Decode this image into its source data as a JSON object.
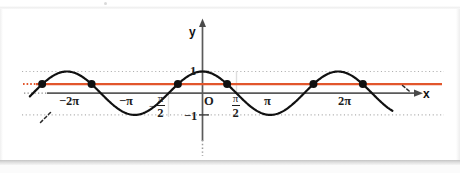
{
  "figure": {
    "axis_labels": {
      "x": "x",
      "y": "y",
      "origin": "O"
    },
    "y_ticks": [
      {
        "value": 1,
        "label": "1"
      },
      {
        "value": -1,
        "label": "−1"
      }
    ],
    "x_ticks": [
      {
        "value": -6.2832,
        "label": "−2π",
        "kind": "plain"
      },
      {
        "value": -3.1416,
        "label": "−π",
        "kind": "plain"
      },
      {
        "value": -1.5708,
        "label": "−π/2",
        "kind": "fraction",
        "sign": "−",
        "num": "π",
        "den": "2"
      },
      {
        "value": 1.5708,
        "label": "π/2",
        "kind": "fraction",
        "sign": "",
        "num": "π",
        "den": "2"
      },
      {
        "value": 3.1416,
        "label": "π",
        "kind": "plain"
      },
      {
        "value": 6.2832,
        "label": "2π",
        "kind": "plain"
      }
    ],
    "colors": {
      "curve": "#111111",
      "horizontal_line": "#e2562c",
      "axis": "#4f4f4f",
      "gridline": "#b9b9b9",
      "point": "#111111",
      "page": "#ffffff"
    }
  },
  "chart_data": {
    "type": "line",
    "title": "",
    "subtitle": "",
    "xlabel": "x",
    "ylabel": "y",
    "xlim": [
      -8.8,
      9.4
    ],
    "ylim": [
      -1.45,
      1.75
    ],
    "grid": "dotted horizontal gridlines at y = 1 and y = -1",
    "legend": "none",
    "series": [
      {
        "name": "y = cos x",
        "type": "line",
        "expression": "cos(x)",
        "color": "#111111",
        "linestyle": "solid",
        "linewidth": 2,
        "x_range": [
          -8.0,
          8.8
        ],
        "amplitude": 1,
        "period": 6.2832,
        "key_points": [
          {
            "x": -6.2832,
            "y": 1,
            "note": "maximum near -2π side"
          },
          {
            "x": -3.1416,
            "y": -1,
            "note": "minimum at -π"
          },
          {
            "x": 0,
            "y": 1,
            "note": "maximum at 0"
          },
          {
            "x": 3.1416,
            "y": -1,
            "note": "minimum at π"
          },
          {
            "x": 6.2832,
            "y": 1,
            "note": "maximum at 2π"
          }
        ]
      },
      {
        "name": "y = k (horizontal line)",
        "type": "hline",
        "y_value": 0.42,
        "color": "#e2562c",
        "linestyle": "solid",
        "linewidth": 2,
        "x_range": [
          -8.6,
          9.2
        ],
        "dotted_extension_left": true
      }
    ],
    "intersection_points": {
      "marker": "filled circle",
      "color": "#111111",
      "size": 4,
      "y": 0.42,
      "x_values": [
        -7.43,
        -5.14,
        -1.14,
        1.14,
        5.14,
        7.43
      ]
    },
    "annotations": [
      {
        "text": "dashed tail at lower-left end of curve",
        "x": -8.4,
        "y": -1.25
      },
      {
        "text": "dashed tail at right end of curve",
        "x": 8.9,
        "y": 0.3
      },
      {
        "text": "y-axis continues below as a dotted line",
        "x": 0,
        "y": -3.2
      }
    ]
  }
}
